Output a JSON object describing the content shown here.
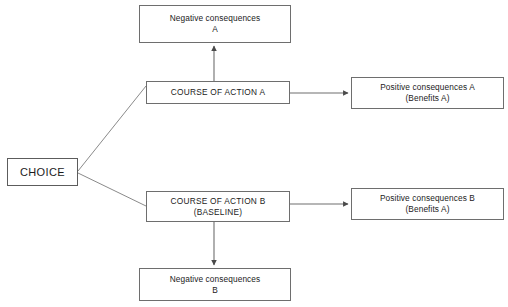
{
  "diagram": {
    "background_color": "#ffffff",
    "line_color": "#6e6e6e",
    "text_color": "#1b1b1b",
    "nodes": {
      "choice": {
        "label": "CHOICE"
      },
      "course_a": {
        "line1": "COURSE OF ACTION A"
      },
      "course_b": {
        "line1": "COURSE OF ACTION B",
        "line2": "(BASELINE)"
      },
      "negative_a": {
        "line1": "Negative consequences",
        "line2": "A"
      },
      "negative_b": {
        "line1": "Negative consequences",
        "line2": "B"
      },
      "positive_a": {
        "line1": "Positive consequences A",
        "line2": "(Benefits A)"
      },
      "positive_b": {
        "line1": "Positive consequences B",
        "line2": "(Benefits A)"
      }
    },
    "edges": [
      {
        "name": "choice-to-course-a",
        "from": "choice",
        "to": "course_a",
        "arrowhead": false
      },
      {
        "name": "choice-to-course-b",
        "from": "choice",
        "to": "course_b",
        "arrowhead": false
      },
      {
        "name": "course-a-to-negative-a",
        "from": "course_a",
        "to": "negative_a",
        "arrowhead": true
      },
      {
        "name": "course-a-to-positive-a",
        "from": "course_a",
        "to": "positive_a",
        "arrowhead": true
      },
      {
        "name": "course-b-to-negative-b",
        "from": "course_b",
        "to": "negative_b",
        "arrowhead": true
      },
      {
        "name": "course-b-to-positive-b",
        "from": "course_b",
        "to": "positive_b",
        "arrowhead": true
      }
    ]
  }
}
